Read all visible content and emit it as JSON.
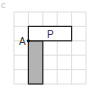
{
  "figure_label": "c",
  "grid": {
    "cols": 5,
    "rows": 5,
    "cell": 14.4,
    "origin": [
      14,
      12
    ],
    "line_color": "#dddddd"
  },
  "shapes": {
    "rect_p": {
      "label": "P",
      "col": 1,
      "row": 1,
      "width_cells": 3,
      "height_cells": 1,
      "fill": "#ffffff",
      "stroke": "#222222"
    },
    "rect_shaded": {
      "col": 1,
      "row": 2,
      "width_cells": 1,
      "height_cells": 3,
      "fill": "#b3b3b3",
      "stroke": "#222222"
    }
  },
  "point": {
    "label": "A",
    "col": 1,
    "row": 2
  }
}
